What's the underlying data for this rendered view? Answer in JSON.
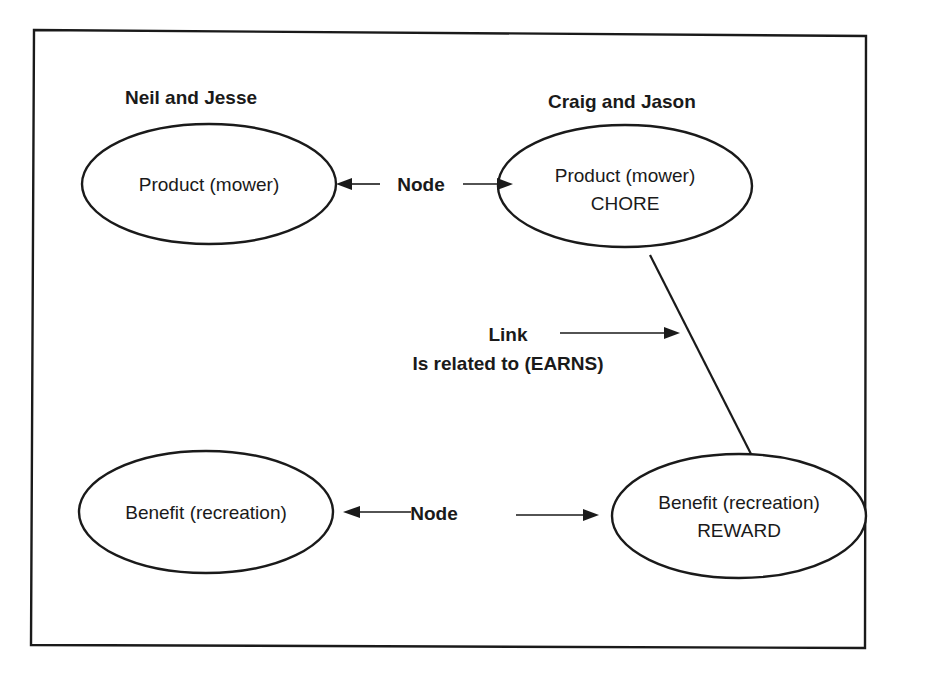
{
  "diagram": {
    "groups": {
      "left": {
        "title": "Neil and Jesse"
      },
      "right": {
        "title": "Craig and Jason"
      }
    },
    "nodes": {
      "left_product": {
        "line1": "Product (mower)"
      },
      "right_product": {
        "line1": "Product (mower)",
        "line2": "CHORE"
      },
      "left_benefit": {
        "line1": "Benefit (recreation)"
      },
      "right_benefit": {
        "line1": "Benefit (recreation)",
        "line2": "REWARD"
      }
    },
    "annotations": {
      "top_node_label": "Node",
      "bottom_node_label": "Node",
      "link_label": "Link",
      "link_relation": "Is related to (EARNS)"
    },
    "colors": {
      "ink": "#1a1a1a",
      "background": "#ffffff"
    }
  }
}
